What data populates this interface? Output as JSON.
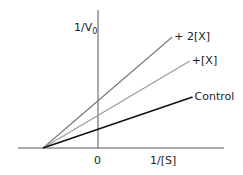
{
  "chart_data": {
    "type": "line",
    "title": "",
    "xlabel": "1/[S]",
    "ylabel": "1/V0",
    "ylabel_main": "1/V",
    "ylabel_sub": "0",
    "x_tick_labels": [
      "0"
    ],
    "xlim": [
      -1,
      2.2
    ],
    "ylim": [
      0,
      4.5
    ],
    "grid": false,
    "legend": "inline-labels",
    "convergence_x": -1,
    "series": [
      {
        "name": "+ 2[X]",
        "color": "#777777",
        "x": [
          -1,
          1.35
        ],
        "y": [
          0,
          3.7
        ],
        "y_intercept": 1.57
      },
      {
        "name": "+[X]",
        "color": "#999999",
        "x": [
          -1,
          1.67
        ],
        "y": [
          0,
          2.9
        ],
        "y_intercept": 1.09
      },
      {
        "name": "Control",
        "color": "#111111",
        "x": [
          -1,
          1.72
        ],
        "y": [
          0,
          1.7
        ],
        "y_intercept": 0.62
      }
    ]
  }
}
